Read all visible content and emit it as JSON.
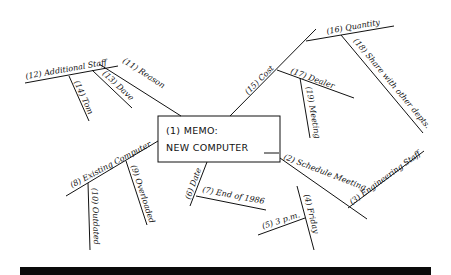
{
  "diagram": {
    "type": "mind-map",
    "center": {
      "line1": "(1) MEMO:",
      "line2": "NEW COMPUTER"
    },
    "nodes": {
      "n2": "(2) Schedule Meeting",
      "n3": "(3) Engineering Staff",
      "n4": "(4) Friday",
      "n5": "(5) 3 p.m.",
      "n6": "(6) Date",
      "n7": "(7) End of 1986",
      "n8": "(8) Existing Computer",
      "n9": "(9) Overloaded",
      "n10": "(10) Outdated",
      "n11": "(11) Reason",
      "n12": "(12) Additional Staff",
      "n13": "(13) Dave",
      "n14": "(14) Tom",
      "n15": "(15) Cost",
      "n16": "(16) Quantity",
      "n17": "(17) Dealer",
      "n18": "(18) Share with other depts.",
      "n19": "(19) Meeting"
    },
    "hierarchy": [
      {
        "id": "n2",
        "children": [
          {
            "id": "n3"
          },
          {
            "id": "n4",
            "children": [
              {
                "id": "n5"
              }
            ]
          }
        ]
      },
      {
        "id": "n6",
        "children": [
          {
            "id": "n7"
          }
        ]
      },
      {
        "id": "n8",
        "children": [
          {
            "id": "n9"
          },
          {
            "id": "n10"
          }
        ]
      },
      {
        "id": "n11",
        "children": [
          {
            "id": "n12",
            "children": [
              {
                "id": "n13"
              },
              {
                "id": "n14"
              }
            ]
          }
        ]
      },
      {
        "id": "n15",
        "children": [
          {
            "id": "n16",
            "children": [
              {
                "id": "n18"
              }
            ]
          },
          {
            "id": "n17",
            "children": [
              {
                "id": "n19"
              }
            ]
          }
        ]
      }
    ]
  }
}
